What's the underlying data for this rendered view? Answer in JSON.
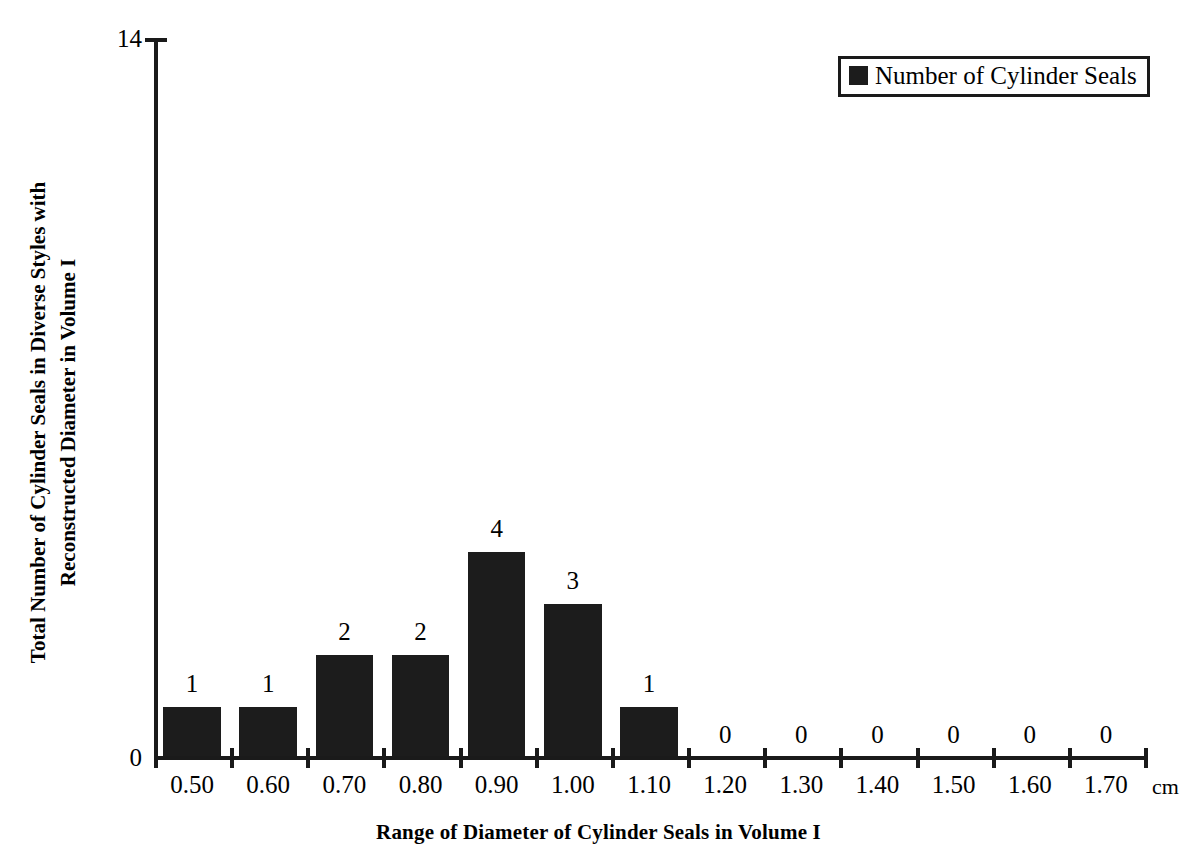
{
  "chart_data": {
    "type": "bar",
    "title": "",
    "xlabel": "Range of Diameter of Cylinder Seals in Volume I",
    "ylabel_lines": [
      "Total Number of Cylinder Seals in Diverse Styles with",
      "Reconstructed Diameter in Volume I"
    ],
    "categories": [
      "0.50",
      "0.60",
      "0.70",
      "0.80",
      "0.90",
      "1.00",
      "1.10",
      "1.20",
      "1.30",
      "1.40",
      "1.50",
      "1.60",
      "1.70"
    ],
    "values": [
      1,
      1,
      2,
      2,
      4,
      3,
      1,
      0,
      0,
      0,
      0,
      0,
      0
    ],
    "value_labels": [
      "1",
      "1",
      "2",
      "2",
      "4",
      "3",
      "1",
      "0",
      "0",
      "0",
      "0",
      "0",
      "0"
    ],
    "x_unit": "cm",
    "ylim": [
      0,
      14
    ],
    "y_tick_labels": {
      "min": "0",
      "max": "14"
    },
    "grid": false,
    "legend": {
      "position": "top-right",
      "entries": [
        {
          "label": "Number of Cylinder Seals",
          "color": "#1c1c1c"
        }
      ]
    },
    "series": [
      {
        "name": "Number of Cylinder Seals",
        "color": "#1c1c1c",
        "values": [
          1,
          1,
          2,
          2,
          4,
          3,
          1,
          0,
          0,
          0,
          0,
          0,
          0
        ]
      }
    ]
  },
  "colors": {
    "bar": "#1c1c1c",
    "axis": "#1a1a1a",
    "background": "#ffffff",
    "text": "#000000"
  }
}
